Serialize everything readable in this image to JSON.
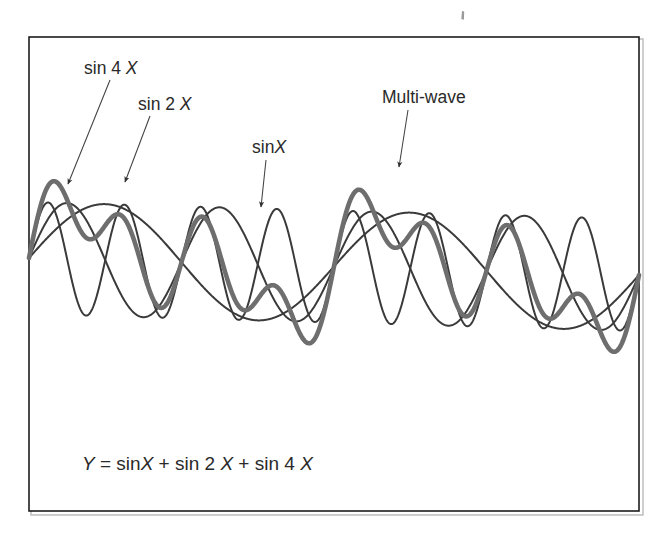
{
  "figure": {
    "background_color": "#ffffff",
    "frame": {
      "x": 28,
      "y": 36,
      "width": 612,
      "height": 476,
      "border_color": "#1d1d1d"
    },
    "speck_mark": "stray-ink-mark"
  },
  "labels": [
    {
      "id": "sin4x",
      "prefix": "sin 4 ",
      "variable": "X",
      "text": "sin 4 X",
      "text_x": 84,
      "text_y": 74,
      "leader": {
        "x1": 110,
        "y1": 80,
        "x2": 68,
        "y2": 184
      },
      "arrow_angle_deg": 112
    },
    {
      "id": "sin2x",
      "prefix": "sin 2 ",
      "variable": "X",
      "text": "sin 2 X",
      "text_x": 138,
      "text_y": 110,
      "leader": {
        "x1": 150,
        "y1": 116,
        "x2": 125,
        "y2": 182
      },
      "arrow_angle_deg": 110
    },
    {
      "id": "sinx",
      "prefix": "sin",
      "variable": "X",
      "text": "sinX",
      "text_x": 252,
      "text_y": 153,
      "leader": {
        "x1": 266,
        "y1": 160,
        "x2": 261,
        "y2": 207
      },
      "arrow_angle_deg": 97
    },
    {
      "id": "multiwave",
      "prefix": "Multi-wave",
      "variable": "",
      "text": "Multi-wave",
      "text_x": 382,
      "text_y": 103,
      "leader": {
        "x1": 408,
        "y1": 110,
        "x2": 399,
        "y2": 167
      },
      "arrow_angle_deg": 99
    }
  ],
  "equation": {
    "text": "Y = sinX + sin 2 X + sin 4 X",
    "x": 82,
    "y": 470,
    "parts": [
      {
        "t": "Y",
        "italic": true
      },
      {
        "t": " = ",
        "italic": false
      },
      {
        "t": "sin",
        "italic": false
      },
      {
        "t": "X",
        "italic": true
      },
      {
        "t": " + ",
        "italic": false
      },
      {
        "t": "sin 2 ",
        "italic": false
      },
      {
        "t": "X",
        "italic": true
      },
      {
        "t": " + ",
        "italic": false
      },
      {
        "t": "sin 4 ",
        "italic": false
      },
      {
        "t": "X",
        "italic": true
      }
    ]
  },
  "chart_data": {
    "type": "line",
    "title": "",
    "subtitle": "",
    "xlabel": "",
    "ylabel": "",
    "grid": false,
    "axes_visible": false,
    "legend": "inline-annotations",
    "x_domain_radians": [
      0,
      12.566370614
    ],
    "x_domain_label": "0 to 4π",
    "y_range": [
      -3,
      3
    ],
    "plot_box_px": {
      "x": 29,
      "y": 37,
      "width": 610,
      "height": 474
    },
    "baseline_y_px": 258,
    "amplitude_px_per_unit": 56,
    "series": [
      {
        "name": "sinX",
        "formula": "sin(X)",
        "amplitude": 1,
        "frequency": 1,
        "cycles_shown": 2,
        "color": "#3a3a3a",
        "width_px": 2.0,
        "style": "thin"
      },
      {
        "name": "sin 2 X",
        "formula": "sin(2X)",
        "amplitude": 1,
        "frequency": 2,
        "cycles_shown": 4,
        "color": "#3a3a3a",
        "width_px": 2.0,
        "style": "thin"
      },
      {
        "name": "sin 4 X",
        "formula": "sin(4X)",
        "amplitude": 1,
        "frequency": 4,
        "cycles_shown": 8,
        "color": "#3a3a3a",
        "width_px": 2.0,
        "style": "thin"
      },
      {
        "name": "Multi-wave",
        "formula": "sin(X) + sin(2X) + sin(4X)",
        "amplitude": 3,
        "frequency": null,
        "cycles_shown": 2,
        "color": "#6e6e6e",
        "width_px": 4.6,
        "style": "thick"
      }
    ],
    "notable_points": [
      {
        "series": "Multi-wave",
        "label": "global maximum",
        "x_px": 75,
        "y_px": 100,
        "value_approx": 2.8
      },
      {
        "series": "Multi-wave",
        "label": "global minimum",
        "x_px": 595,
        "y_px": 440,
        "value_approx": -3.2
      },
      {
        "series": "all",
        "label": "common zero at left edge",
        "x_px": 29,
        "y_px": 258,
        "value_approx": 0
      },
      {
        "series": "all",
        "label": "common zero at right edge",
        "x_px": 639,
        "y_px": 275,
        "value_approx": 0
      }
    ]
  }
}
